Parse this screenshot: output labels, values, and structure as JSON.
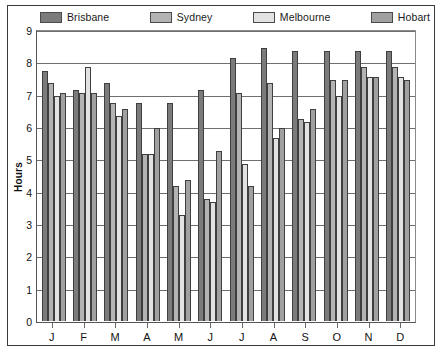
{
  "chart_data": {
    "type": "bar",
    "title": "",
    "subtitle": "",
    "xlabel": "",
    "ylabel": "Hours",
    "ylim": [
      0,
      9
    ],
    "yticks": [
      0,
      1,
      2,
      3,
      4,
      5,
      6,
      7,
      8,
      9
    ],
    "ytick_labels": [
      "0",
      "1",
      "2",
      "3",
      "4",
      "5",
      "6",
      "7",
      "8",
      "9"
    ],
    "grid": true,
    "legend_position": "top",
    "categories": [
      "J",
      "F",
      "M",
      "A",
      "M",
      "J",
      "J",
      "A",
      "S",
      "O",
      "N",
      "D"
    ],
    "category_names": [
      "January",
      "February",
      "March",
      "April",
      "May",
      "June",
      "July",
      "August",
      "September",
      "October",
      "November",
      "December"
    ],
    "series": [
      {
        "name": "Brisbane",
        "color": "#7b7b7b",
        "values": [
          7.8,
          7.2,
          7.4,
          6.8,
          6.8,
          7.2,
          8.2,
          8.5,
          8.4,
          8.4,
          8.4,
          8.4
        ]
      },
      {
        "name": "Sydney",
        "color": "#b3b3b3",
        "values": [
          7.4,
          7.1,
          6.8,
          5.2,
          4.2,
          3.8,
          7.1,
          7.4,
          6.3,
          7.5,
          7.9,
          7.9
        ]
      },
      {
        "name": "Melbourne",
        "color": "#e2e2e2",
        "values": [
          7.0,
          7.9,
          6.4,
          5.2,
          3.3,
          3.7,
          4.9,
          5.7,
          6.2,
          7.0,
          7.6,
          7.6
        ]
      },
      {
        "name": "Hobart",
        "color": "#a0a0a0",
        "values": [
          7.1,
          7.1,
          6.6,
          6.0,
          4.4,
          5.3,
          4.2,
          6.0,
          6.6,
          7.5,
          7.6,
          7.5
        ]
      }
    ]
  },
  "legend": {
    "items": [
      {
        "label": "Brisbane",
        "color": "#7b7b7b"
      },
      {
        "label": "Sydney",
        "color": "#b3b3b3"
      },
      {
        "label": "Melbourne",
        "color": "#e2e2e2"
      },
      {
        "label": "Hobart",
        "color": "#a0a0a0"
      }
    ]
  },
  "axis": {
    "y_title": "Hours"
  }
}
